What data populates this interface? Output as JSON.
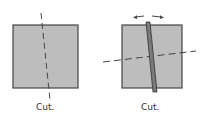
{
  "figures": [
    {
      "label": "Cut.",
      "fill": "#bdbdbd",
      "stroke": "#444444"
    },
    {
      "label": "Cut.",
      "fill": "#bdbdbd",
      "stroke": "#444444",
      "bar_fill": "#7a7a7a"
    }
  ]
}
